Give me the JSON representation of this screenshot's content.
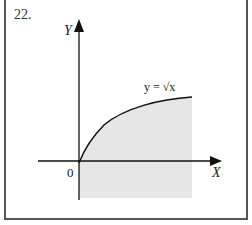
{
  "problem_number": "22.",
  "diagram": {
    "y_axis_label": "Y",
    "x_axis_label": "X",
    "origin_label": "0",
    "curve_label": "y = √x",
    "shade_color": "#e6e6e6",
    "axis_color": "#111111",
    "curve_color": "#111111"
  }
}
